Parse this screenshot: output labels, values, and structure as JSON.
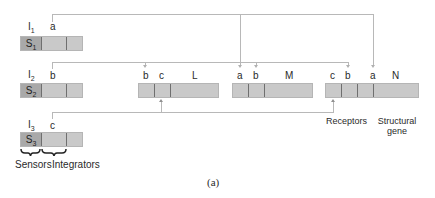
{
  "diagram": {
    "rows": [
      {
        "integrator_label": "I",
        "integrator_sub": "1",
        "sensor_label": "S",
        "sensor_sub": "1",
        "signal": "a"
      },
      {
        "integrator_label": "I",
        "integrator_sub": "2",
        "sensor_label": "S",
        "sensor_sub": "2",
        "signal": "b"
      },
      {
        "integrator_label": "I",
        "integrator_sub": "3",
        "sensor_label": "S",
        "sensor_sub": "3",
        "signal": "c"
      }
    ],
    "genes": [
      {
        "name": "L",
        "receptors": [
          "b",
          "c"
        ]
      },
      {
        "name": "M",
        "receptors": [
          "a",
          "b"
        ]
      },
      {
        "name": "N",
        "receptors": [
          "c",
          "b",
          "a"
        ]
      }
    ],
    "brace_labels": {
      "sensors": "Sensors",
      "integrators": "Integrators"
    },
    "annotations": {
      "receptors": "Receptors",
      "structural_gene_line1": "Structural",
      "structural_gene_line2": "gene"
    },
    "caption": "(a)"
  }
}
